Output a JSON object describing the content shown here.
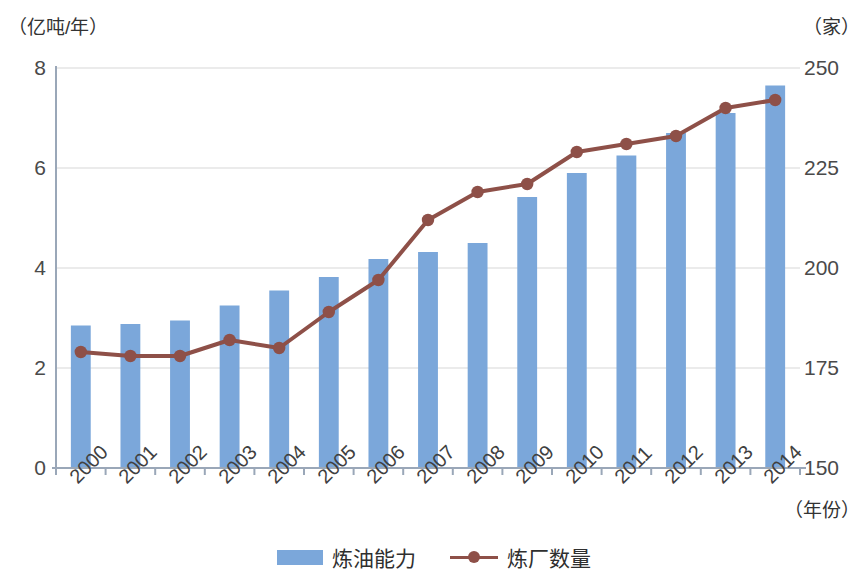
{
  "axes": {
    "left_unit": "（亿吨/年）",
    "right_unit": "（家）",
    "x_unit": "（年份）",
    "left_ticks": [
      "0",
      "2",
      "4",
      "6",
      "8"
    ],
    "right_ticks": [
      "150",
      "175",
      "200",
      "225",
      "250"
    ]
  },
  "legend": {
    "bar_label": "炼油能力",
    "line_label": "炼厂数量"
  },
  "colors": {
    "bar": "#7BA7DA",
    "line": "#8E5048",
    "grid": "#E4E4E4",
    "axis": "#9AA7B8",
    "text": "#3a3a3a"
  },
  "chart_data": {
    "type": "bar",
    "title": "",
    "subtitle": "",
    "xlabel": "（年份）",
    "ylabel": "（亿吨/年）",
    "y2label": "（家）",
    "ylim": [
      0,
      8
    ],
    "y2lim": [
      150,
      250
    ],
    "yticks": [
      0,
      2,
      4,
      6,
      8
    ],
    "y2ticks": [
      150,
      175,
      200,
      225,
      250
    ],
    "grid": true,
    "legend_position": "bottom-center",
    "categories": [
      "2000",
      "2001",
      "2002",
      "2003",
      "2004",
      "2005",
      "2006",
      "2007",
      "2008",
      "2009",
      "2010",
      "2011",
      "2012",
      "2013",
      "2014"
    ],
    "series": [
      {
        "name": "炼油能力",
        "kind": "bar",
        "axis": "left",
        "unit": "亿吨/年",
        "color": "#7BA7DA",
        "values": [
          2.85,
          2.88,
          2.95,
          3.25,
          3.55,
          3.82,
          4.18,
          4.32,
          4.5,
          5.42,
          5.9,
          6.25,
          6.7,
          7.1,
          7.65
        ]
      },
      {
        "name": "炼厂数量",
        "kind": "line",
        "axis": "right",
        "unit": "家",
        "color": "#8E5048",
        "marker": "circle",
        "values": [
          179,
          178,
          178,
          182,
          180,
          189,
          197,
          212,
          219,
          221,
          229,
          231,
          233,
          240,
          242
        ]
      }
    ]
  }
}
